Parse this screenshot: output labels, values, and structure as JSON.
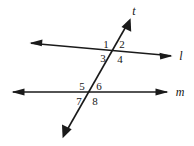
{
  "figure": {
    "kind": "geometry-diagram",
    "width": 194,
    "height": 146,
    "background_color": "#ffffff",
    "stroke_color": "#1a1a1a"
  },
  "lines": [
    {
      "id": "line-l",
      "label": "l",
      "label_x": 181,
      "label_y": 56,
      "x1": 30,
      "y1": 43,
      "x2": 172,
      "y2": 56,
      "arrow_start": true,
      "arrow_end": true
    },
    {
      "id": "line-m",
      "label": "m",
      "label_x": 180,
      "label_y": 92,
      "x1": 12,
      "y1": 92,
      "x2": 168,
      "y2": 92,
      "arrow_start": true,
      "arrow_end": true
    },
    {
      "id": "line-t",
      "label": "t",
      "label_x": 134,
      "label_y": 11,
      "x1": 63,
      "y1": 137,
      "x2": 130,
      "y2": 19,
      "arrow_start": true,
      "arrow_end": true
    }
  ],
  "intersections": [
    {
      "id": "intersection-upper",
      "x": 113,
      "y": 51,
      "lines": [
        "line-l",
        "line-t"
      ]
    },
    {
      "id": "intersection-lower",
      "x": 90,
      "y": 92,
      "lines": [
        "line-m",
        "line-t"
      ]
    }
  ],
  "angle_labels": [
    {
      "id": "angle-1",
      "text": "1",
      "x": 106,
      "y": 44,
      "intersection": "intersection-upper",
      "position": "upper-left"
    },
    {
      "id": "angle-2",
      "text": "2",
      "x": 122,
      "y": 44,
      "intersection": "intersection-upper",
      "position": "upper-right"
    },
    {
      "id": "angle-3",
      "text": "3",
      "x": 103,
      "y": 58,
      "intersection": "intersection-upper",
      "position": "lower-left"
    },
    {
      "id": "angle-4",
      "text": "4",
      "x": 120,
      "y": 59,
      "intersection": "intersection-upper",
      "position": "lower-right"
    },
    {
      "id": "angle-5",
      "text": "5",
      "x": 82,
      "y": 86,
      "intersection": "intersection-lower",
      "position": "upper-left"
    },
    {
      "id": "angle-6",
      "text": "6",
      "x": 99,
      "y": 86,
      "intersection": "intersection-lower",
      "position": "upper-right"
    },
    {
      "id": "angle-7",
      "text": "7",
      "x": 79,
      "y": 101,
      "intersection": "intersection-lower",
      "position": "lower-left"
    },
    {
      "id": "angle-8",
      "text": "8",
      "x": 95,
      "y": 101,
      "intersection": "intersection-lower",
      "position": "lower-right"
    }
  ]
}
